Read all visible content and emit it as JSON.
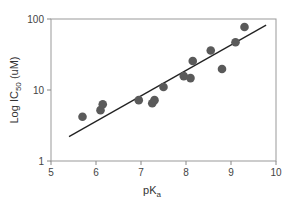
{
  "chart_data": {
    "type": "scatter",
    "title": "",
    "xlabel": "pKa",
    "xlabel_main": "pK",
    "xlabel_sub": "a",
    "ylabel": "Log IC50 (uM)",
    "ylabel_prefix": "Log IC",
    "ylabel_sub": "50",
    "ylabel_suffix": " (uM)",
    "xlim": [
      5,
      10
    ],
    "ylim": [
      1,
      100
    ],
    "yscale": "log",
    "grid": false,
    "xticks": [
      "5",
      "6",
      "7",
      "8",
      "9",
      "10"
    ],
    "yticks": [
      "1",
      "10",
      "100"
    ],
    "points": [
      {
        "x": 5.7,
        "y": 4.2
      },
      {
        "x": 6.1,
        "y": 5.2
      },
      {
        "x": 6.15,
        "y": 6.3
      },
      {
        "x": 6.95,
        "y": 7.2
      },
      {
        "x": 7.25,
        "y": 6.5
      },
      {
        "x": 7.3,
        "y": 7.2
      },
      {
        "x": 7.5,
        "y": 11
      },
      {
        "x": 7.95,
        "y": 15.7
      },
      {
        "x": 8.1,
        "y": 14.7
      },
      {
        "x": 8.15,
        "y": 25.6
      },
      {
        "x": 8.55,
        "y": 36
      },
      {
        "x": 8.8,
        "y": 19.8
      },
      {
        "x": 9.1,
        "y": 47
      },
      {
        "x": 9.3,
        "y": 77
      }
    ],
    "fit_line": {
      "x1": 5.4,
      "y1": 2.2,
      "x2": 9.78,
      "y2": 82
    },
    "colors": {
      "marker": "#5a5a5a",
      "line": "#222222",
      "axis": "#888888"
    }
  }
}
